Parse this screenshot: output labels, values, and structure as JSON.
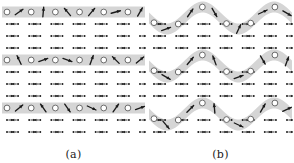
{
  "figure": {
    "type": "spin-lattice-diagram",
    "width": 294,
    "height": 163,
    "background_color": "#ffffff",
    "band_color": "#d5d5d5",
    "spin_color": "#1a1a1a",
    "circle_fill": "#ffffff",
    "circle_stroke": "#555555"
  },
  "panels": [
    {
      "id": "a",
      "caption": "(a)",
      "band_shape": "straight",
      "rows": 11,
      "lattice_columns": 13,
      "band_rows": [
        0,
        4,
        8
      ],
      "band_thickness": 11,
      "band_circles_per_row": 6,
      "band_spin_angles_deg": [
        [
          35,
          85,
          130,
          50,
          15,
          60
        ],
        [
          115,
          20,
          340,
          70,
          135,
          40
        ],
        [
          40,
          125,
          305,
          335,
          55,
          20
        ]
      ],
      "lattice_row_y": [
        12,
        24,
        36,
        48,
        60,
        72,
        84,
        96,
        108,
        120,
        132
      ],
      "lattice_arrow_pattern": "alternating-horizontal"
    },
    {
      "id": "b",
      "caption": "(b)",
      "band_shape": "sinusoidal",
      "rows": 11,
      "lattice_columns": 13,
      "band_center_rows": [
        0,
        4,
        8
      ],
      "band_thickness": 11,
      "band_wave_amplitude": 11,
      "band_wave_periods": 2,
      "band_circles_per_row": 6,
      "band_spin_angles_deg": [
        [
          20,
          55,
          300,
          65,
          25,
          330
        ],
        [
          330,
          50,
          110,
          20,
          300,
          70
        ],
        [
          310,
          45,
          95,
          335,
          60,
          25
        ]
      ],
      "lattice_row_y": [
        12,
        24,
        36,
        48,
        60,
        72,
        84,
        96,
        108,
        120,
        132
      ],
      "lattice_arrow_pattern": "alternating-horizontal"
    }
  ]
}
